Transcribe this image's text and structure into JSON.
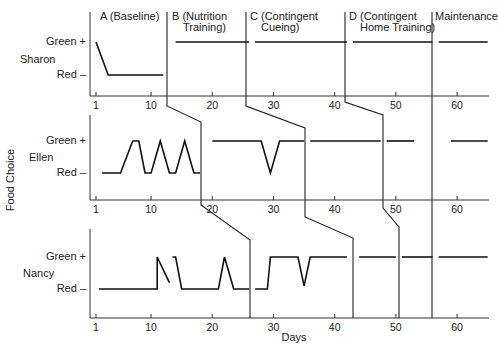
{
  "chart_data": {
    "type": "line",
    "title": "",
    "xlabel": "Days",
    "ylabel": "Food Choice",
    "x_ticks": [
      1,
      10,
      20,
      30,
      40,
      50,
      60
    ],
    "y_levels": [
      "Red –",
      "Green +"
    ],
    "phases": [
      {
        "label": "A (Baseline)",
        "lines": [
          "A (Baseline)"
        ]
      },
      {
        "label": "B (Nutrition Training)",
        "lines": [
          "B (Nutrition",
          "Training)"
        ]
      },
      {
        "label": "C (Contingent Cueing)",
        "lines": [
          "C (Contingent",
          "Cueing)"
        ]
      },
      {
        "label": "D (Contingent Home Training)",
        "lines": [
          "D (Contingent",
          "Home Training)"
        ]
      },
      {
        "label": "Maintenance",
        "lines": [
          "Maintenance"
        ]
      }
    ],
    "series": [
      {
        "name": "Sharon",
        "phase_change_days": [
          13,
          26,
          42,
          56
        ],
        "segments": [
          [
            [
              1,
              1
            ],
            [
              3,
              0
            ],
            [
              12,
              0
            ]
          ],
          [
            [
              14,
              1
            ],
            [
              26,
              1
            ]
          ],
          [
            [
              27,
              1
            ],
            [
              42,
              1
            ]
          ],
          [
            [
              43,
              1
            ],
            [
              56,
              1
            ]
          ],
          [
            [
              57,
              1
            ],
            [
              65,
              1
            ]
          ]
        ]
      },
      {
        "name": "Ellen",
        "phase_change_days": [
          19,
          36,
          48,
          56
        ],
        "segments": [
          [
            [
              2,
              0
            ],
            [
              5,
              0
            ],
            [
              7,
              1
            ],
            [
              8,
              1
            ],
            [
              9,
              0
            ],
            [
              10,
              0
            ],
            [
              11.5,
              1
            ],
            [
              13,
              0
            ],
            [
              14,
              0
            ],
            [
              15.5,
              1
            ],
            [
              17,
              0
            ],
            [
              18,
              0
            ]
          ],
          [
            [
              20,
              1
            ],
            [
              28,
              1
            ],
            [
              29.5,
              0
            ],
            [
              31,
              1
            ],
            [
              35,
              1
            ]
          ],
          [
            [
              36,
              1
            ],
            [
              47.5,
              1
            ]
          ],
          [
            [
              48.5,
              1
            ],
            [
              53,
              1
            ]
          ],
          [
            [
              59,
              1
            ],
            [
              65,
              1
            ]
          ]
        ]
      },
      {
        "name": "Nancy",
        "phase_change_days": [
          26,
          43,
          51,
          56
        ],
        "segments": [
          [
            [
              1.5,
              0
            ],
            [
              11,
              0
            ],
            [
              11,
              1
            ],
            [
              13,
              0.2
            ]
          ],
          [
            [
              13.5,
              1
            ],
            [
              14,
              1
            ],
            [
              15,
              0
            ],
            [
              21,
              0
            ],
            [
              22,
              1
            ],
            [
              23.5,
              0
            ],
            [
              26,
              0
            ]
          ],
          [
            [
              27,
              0
            ],
            [
              29,
              0
            ],
            [
              29.5,
              1
            ],
            [
              34,
              1
            ],
            [
              35,
              0.1
            ],
            [
              36,
              1
            ],
            [
              42,
              1
            ]
          ],
          [
            [
              44,
              1
            ],
            [
              50,
              1
            ]
          ],
          [
            [
              51,
              1
            ],
            [
              56,
              1
            ]
          ],
          [
            [
              57,
              1
            ],
            [
              65,
              1
            ]
          ]
        ]
      }
    ]
  },
  "labels": {
    "y_axis_title": "Food Choice",
    "x_axis_title": "Days",
    "green": "Green +",
    "red": "Red –",
    "tick_labels": [
      "1",
      "10",
      "20",
      "30",
      "40",
      "50",
      "60"
    ],
    "participants": [
      "Sharon",
      "Ellen",
      "Nancy"
    ],
    "phase_headers": [
      [
        "A (Baseline)"
      ],
      [
        "B (Nutrition",
        "Training)"
      ],
      [
        "C (Contingent",
        "Cueing)"
      ],
      [
        "D (Contingent",
        "Home Training)"
      ],
      [
        "Maintenance"
      ]
    ]
  }
}
